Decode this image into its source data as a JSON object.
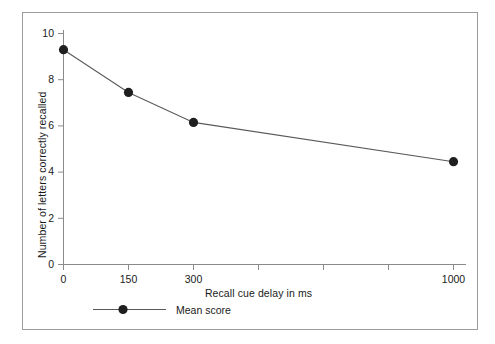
{
  "chart_data": {
    "type": "line",
    "title": "",
    "subtitle": "",
    "xlabel": "Recall cue delay in ms",
    "ylabel": "Number of letters correctly recalled",
    "categories": [
      "0",
      "150",
      "300",
      "1000"
    ],
    "x_tick_labels": [
      "0",
      "150",
      "300",
      "",
      "",
      "",
      "1000"
    ],
    "x_tick_count": 7,
    "y_tick_labels": [
      "0",
      "2",
      "4",
      "6",
      "8",
      "10"
    ],
    "ylim": [
      0,
      10
    ],
    "ytick_values": [
      0,
      2,
      4,
      6,
      8,
      10
    ],
    "grid": false,
    "legend_position": "below-axes-left",
    "series": [
      {
        "name": "Mean score",
        "values": [
          9.3,
          7.45,
          6.15,
          4.45
        ],
        "marker": "filled-circle",
        "color": "#1a1a1a"
      }
    ],
    "point_labels": [
      "9.3",
      "7.45",
      "6.15",
      "4.45"
    ]
  },
  "legend": {
    "entries": [
      {
        "label": "Mean score"
      }
    ]
  },
  "colors": {
    "line": "#5a5a5a",
    "marker": "#1f1f1f",
    "axis": "#7a7a7a",
    "text": "#1a1a1a",
    "frame": "#9b9b9b",
    "background": "#ffffff"
  }
}
